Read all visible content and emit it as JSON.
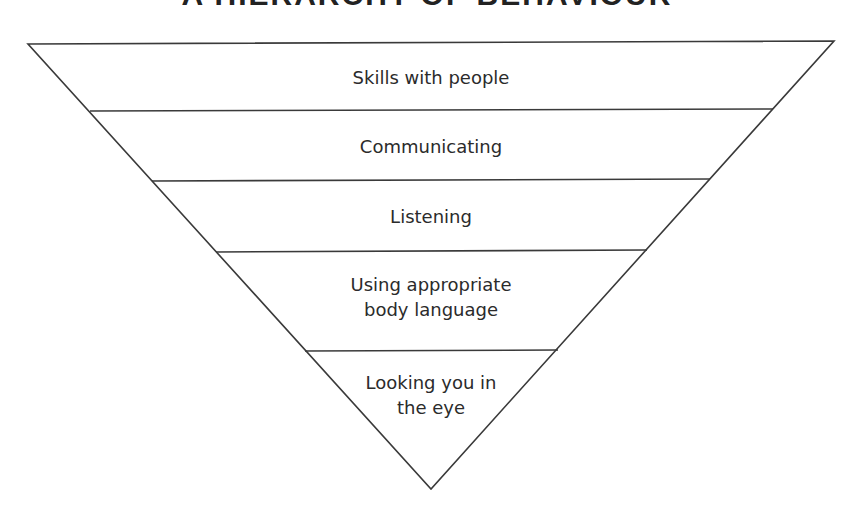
{
  "title": "A HIERARCHY OF BEHAVIOUR",
  "levels": [
    {
      "label": "Skills with people"
    },
    {
      "label": "Communicating"
    },
    {
      "label": "Listening"
    },
    {
      "label": "Using appropriate",
      "label2": "body language"
    },
    {
      "label": "Looking you in",
      "label2": "the eye"
    }
  ],
  "colors": {
    "line": "#3a3a3a",
    "text": "#2b2b2b",
    "background": "#ffffff"
  }
}
